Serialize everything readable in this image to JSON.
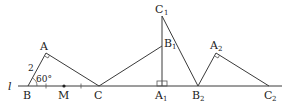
{
  "diagram": {
    "line_label": "l",
    "triangle_abc": {
      "vertices": {
        "A": "A",
        "B": "B",
        "C": "C"
      },
      "midpoint": "M",
      "side_ab_length": "2",
      "angle_b": "60°",
      "right_angle_at": "A"
    },
    "triangle_a1b1c1": {
      "vertices": {
        "A": "A",
        "A_sub": "1",
        "B": "B",
        "B_sub": "1",
        "C": "C",
        "C_sub": "1"
      },
      "right_angle_at": "A1"
    },
    "triangle_a2b2c2": {
      "vertices": {
        "A": "A",
        "A_sub": "2",
        "B": "B",
        "B_sub": "2",
        "C": "C",
        "C_sub": "2"
      },
      "right_angle_at": "A2"
    }
  }
}
